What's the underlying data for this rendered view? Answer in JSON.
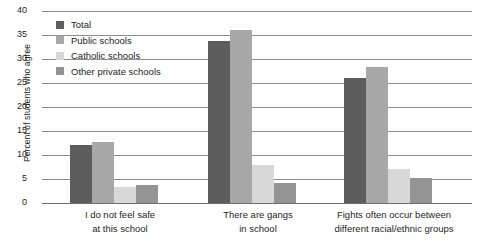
{
  "chart_data": {
    "type": "bar",
    "title": "",
    "xlabel": "",
    "ylabel": "Percent of students who agree",
    "ylim": [
      0,
      40
    ],
    "ytick_values": [
      40,
      35,
      30,
      25,
      20,
      15,
      10,
      5,
      0
    ],
    "ytick_labels": [
      "40",
      "35",
      "30",
      "25",
      "20",
      "15",
      "10",
      "5",
      "0"
    ],
    "grid": "horizontal",
    "legend_position": "top-left-inside",
    "categories": [
      "I do not feel safe at this school",
      "There are gangs in school",
      "Fights often occur between different racial/ethnic groups"
    ],
    "category_lines": [
      [
        "I do not feel safe",
        "at this school"
      ],
      [
        "There are gangs",
        "in school"
      ],
      [
        "Fights often occur between",
        "different racial/ethnic groups"
      ]
    ],
    "series": [
      {
        "name": "Total",
        "color": "#5d5d5d",
        "values": [
          12.0,
          33.8,
          26.0
        ]
      },
      {
        "name": "Public schools",
        "color": "#a8a8a8",
        "values": [
          12.8,
          36.0,
          28.3
        ]
      },
      {
        "name": "Catholic schools",
        "color": "#d8d8d8",
        "values": [
          3.3,
          8.0,
          7.0
        ]
      },
      {
        "name": "Other private schools",
        "color": "#949494",
        "values": [
          3.8,
          4.2,
          5.2
        ]
      }
    ]
  },
  "legend": {
    "items": [
      {
        "label": "Total",
        "swatch": "#5d5d5d"
      },
      {
        "label": "Public schools",
        "swatch": "#a8a8a8"
      },
      {
        "label": "Catholic schools",
        "swatch": "#d8d8d8"
      },
      {
        "label": "Other private schools",
        "swatch": "#949494"
      }
    ]
  },
  "axis": {
    "y_title": "Percent of students who agree"
  }
}
